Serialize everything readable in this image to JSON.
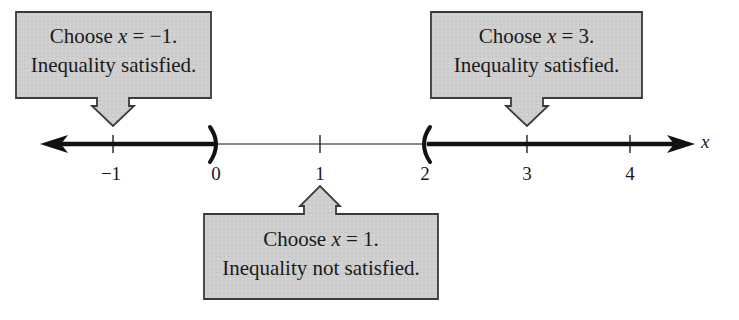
{
  "figure": {
    "type": "number-line-test-intervals",
    "axis": {
      "variable": "x",
      "ticks": [
        {
          "value": -1,
          "label": "−1",
          "px": 113
        },
        {
          "value": 0,
          "label": "0",
          "px": 216
        },
        {
          "value": 1,
          "label": "1",
          "px": 320
        },
        {
          "value": 2,
          "label": "2",
          "px": 425
        },
        {
          "value": 3,
          "label": "3",
          "px": 527
        },
        {
          "value": 4,
          "label": "4",
          "px": 630
        }
      ],
      "shaded_intervals": [
        {
          "from": "-infinity",
          "to": 0,
          "endpoint": "open",
          "symbol": ")"
        },
        {
          "from": 2,
          "to": "infinity",
          "endpoint": "open",
          "symbol": "("
        }
      ]
    },
    "callouts": [
      {
        "id": "left",
        "line1_prefix": "Choose ",
        "line1_var": "x",
        "line1_suffix": " = −1.",
        "line2": "Inequality satisfied.",
        "points_to": -1,
        "direction": "down"
      },
      {
        "id": "right",
        "line1_prefix": "Choose ",
        "line1_var": "x",
        "line1_suffix": " = 3.",
        "line2": "Inequality satisfied.",
        "points_to": 3,
        "direction": "down"
      },
      {
        "id": "middle",
        "line1_prefix": "Choose ",
        "line1_var": "x",
        "line1_suffix": " = 1.",
        "line2": "Inequality not satisfied.",
        "points_to": 1,
        "direction": "up"
      }
    ],
    "colors": {
      "box_fill": "#cfcfcf",
      "box_stroke": "#3a3a3a",
      "line": "#111111",
      "background": "#ffffff"
    }
  }
}
